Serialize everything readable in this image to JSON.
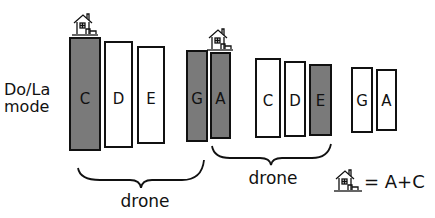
{
  "diagram": {
    "mode_label_line1": "Do/La",
    "mode_label_line2": "mode",
    "bars": [
      {
        "note": "C",
        "filled": true,
        "x": 70,
        "y": 38,
        "w": 30,
        "h": 112
      },
      {
        "note": "D",
        "filled": false,
        "x": 105,
        "y": 42,
        "w": 27,
        "h": 105
      },
      {
        "note": "E",
        "filled": false,
        "x": 138,
        "y": 47,
        "w": 26,
        "h": 96
      },
      {
        "note": "G",
        "filled": true,
        "x": 187,
        "y": 51,
        "w": 20,
        "h": 90
      },
      {
        "note": "A",
        "filled": true,
        "x": 211,
        "y": 53,
        "w": 19,
        "h": 85
      },
      {
        "note": "C",
        "filled": false,
        "x": 256,
        "y": 59,
        "w": 24,
        "h": 78
      },
      {
        "note": "D",
        "filled": false,
        "x": 285,
        "y": 62,
        "w": 20,
        "h": 74
      },
      {
        "note": "E",
        "filled": true,
        "x": 310,
        "y": 65,
        "w": 21,
        "h": 70
      },
      {
        "note": "G",
        "filled": false,
        "x": 352,
        "y": 68,
        "w": 20,
        "h": 64
      },
      {
        "note": "A",
        "filled": false,
        "x": 377,
        "y": 70,
        "w": 19,
        "h": 60
      }
    ],
    "home_markers": [
      {
        "above": "C",
        "x": 73,
        "y": 12
      },
      {
        "above": "A",
        "x": 208,
        "y": 27
      }
    ],
    "braces": [
      {
        "label": "drone",
        "from": "C",
        "to": "G"
      },
      {
        "label": "drone",
        "from": "A",
        "to": "E"
      }
    ],
    "legend": {
      "icon": "house-icon",
      "text": "= A+C"
    },
    "colors": {
      "filled": "#7a7a7a",
      "outline": "#111111",
      "empty": "#ffffff"
    }
  }
}
